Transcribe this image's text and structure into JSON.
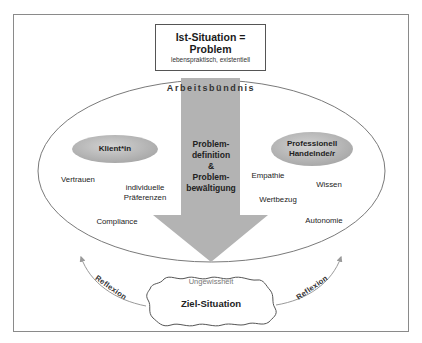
{
  "diagram": {
    "top_box": {
      "title_line1": "Ist-Situation =",
      "title_line2": "Problem",
      "subtitle": "lebenspraktisch, existentiell"
    },
    "ellipse_label": "Arbeitsbündnis",
    "arrow_text": {
      "line1": "Problem-",
      "line2": "definition",
      "line3": "&",
      "line4": "Problem-",
      "line5": "bewältigung"
    },
    "client": {
      "badge": "Klient*in",
      "attributes": [
        "Vertrauen",
        "individuelle",
        "Präferenzen",
        "Compliance"
      ]
    },
    "professional": {
      "badge_line1": "Professionell",
      "badge_line2": "Handelnde/r",
      "attributes": [
        "Empathie",
        "Wissen",
        "Wertbezug",
        "Autonomie"
      ]
    },
    "goal": {
      "uncertainty": "Ungewissheit",
      "label": "Ziel-Situation"
    },
    "reflection_left": "Reflexion",
    "reflection_right": "Reflexion",
    "colors": {
      "arrow_fill": "#b3b3b3",
      "badge_fill": "#bdbdbd",
      "line": "#8a8a8a",
      "frame": "#8a8a8a"
    }
  }
}
